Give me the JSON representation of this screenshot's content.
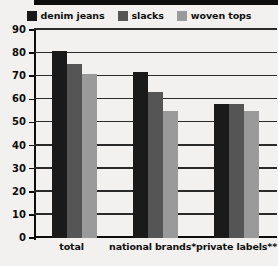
{
  "chart_data": {
    "type": "bar",
    "title": "",
    "subtitle": "",
    "xlabel": "",
    "ylabel": "",
    "ylim": [
      0,
      90
    ],
    "yticks": [
      90,
      80,
      70,
      60,
      50,
      40,
      30,
      20,
      10,
      0
    ],
    "grid": true,
    "legend_position": "top",
    "categories": [
      "total",
      "national brands*",
      "private labels**"
    ],
    "series": [
      {
        "name": "denim jeans",
        "color": "#1a1a1a",
        "values": [
          81,
          72,
          58
        ]
      },
      {
        "name": "slacks",
        "color": "#555555",
        "values": [
          75.5,
          63,
          58
        ]
      },
      {
        "name": "woven tops",
        "color": "#9a9a9a",
        "values": [
          71,
          55,
          55
        ]
      }
    ]
  },
  "legend": {
    "items": [
      {
        "label": "denim jeans",
        "swatch_name": "legend-swatch-denim-jeans"
      },
      {
        "label": "slacks",
        "swatch_name": "legend-swatch-slacks"
      },
      {
        "label": "woven tops",
        "swatch_name": "legend-swatch-woven-tops"
      }
    ]
  },
  "colors": {
    "background": "#f2f1ef",
    "axis": "#0d0d0d",
    "gridline": "#2a2a2a",
    "denim_jeans": "#1a1a1a",
    "slacks": "#555555",
    "woven_tops": "#9a9a9a"
  }
}
